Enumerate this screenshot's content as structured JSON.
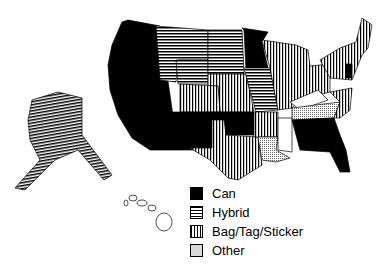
{
  "map": {
    "type": "choropleth",
    "region": "United States",
    "categories": [
      {
        "key": "can",
        "label": "Can",
        "pattern": "solid-black"
      },
      {
        "key": "hybrid",
        "label": "Hybrid",
        "pattern": "horizontal-stripes"
      },
      {
        "key": "bag",
        "label": "Bag/Tag/Sticker",
        "pattern": "vertical-stripes"
      },
      {
        "key": "other",
        "label": "Other",
        "pattern": "dotted"
      }
    ],
    "states": {
      "WA": "can",
      "OR": "can",
      "CA": "can",
      "NV": "can",
      "ID": "can",
      "UT": "can",
      "AZ": "can",
      "MT": "hybrid",
      "ND": "hybrid",
      "SD": "hybrid",
      "WY": "hybrid",
      "MO": "hybrid",
      "IA": "hybrid",
      "AK": "hybrid",
      "MN": "can",
      "NM": "can",
      "OK": "can",
      "FL": "can",
      "GA": "can",
      "NJ": "can",
      "CO": "bag",
      "NE": "bag",
      "KS": "bag",
      "TX": "bag",
      "AR": "bag",
      "WI": "bag",
      "MI": "bag",
      "IL": "bag",
      "IN": "bag",
      "OH": "bag",
      "PA": "bag",
      "NY": "bag",
      "VT": "bag",
      "NH": "bag",
      "ME": "bag",
      "MA": "bag",
      "CT": "bag",
      "WV": "bag",
      "VA": "bag",
      "NC": "bag",
      "SC": "bag",
      "AL": "bag",
      "MD": "bag",
      "DE": "bag",
      "TN": "other",
      "LA": "other",
      "KY": "none",
      "MS": "none",
      "HI": "none"
    }
  },
  "colors": {
    "fill": "#000000",
    "background": "#ffffff"
  }
}
